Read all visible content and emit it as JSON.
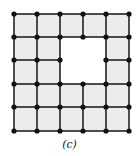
{
  "figure": {
    "caption": "(c)",
    "grid": {
      "cols": 5,
      "rows": 5,
      "node_x": [
        14,
        37,
        60,
        83,
        106,
        129
      ],
      "node_y": [
        14,
        37,
        60,
        84,
        107,
        131
      ],
      "hole": {
        "col_start": 2,
        "col_end": 4,
        "row_start": 1,
        "row_end": 3
      },
      "fill_color": "#ececec",
      "edge_color": "#222222",
      "node_color": "#111111",
      "node_radius": 2.6
    }
  }
}
